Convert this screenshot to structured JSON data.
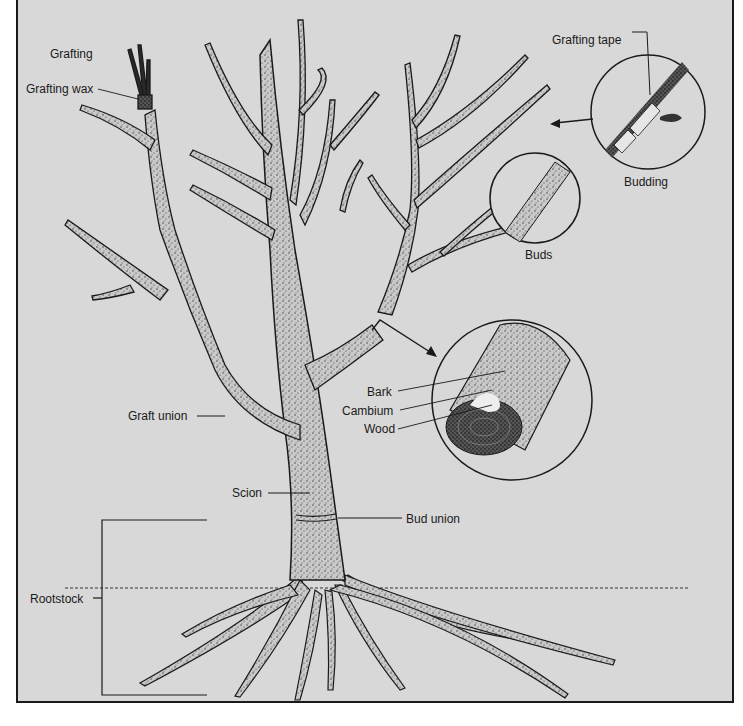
{
  "diagram": {
    "background_color": "#d8d8d8",
    "ink_color": "#1a1a1a",
    "labels": {
      "grafting": "Grafting",
      "grafting_wax": "Grafting wax",
      "grafting_tape": "Grafting tape",
      "budding": "Budding",
      "buds": "Buds",
      "bark": "Bark",
      "cambium": "Cambium",
      "wood": "Wood",
      "graft_union": "Graft union",
      "scion": "Scion",
      "bud_union": "Bud union",
      "rootstock": "Rootstock"
    },
    "insets": [
      {
        "name": "budding-detail",
        "caption": "Budding"
      },
      {
        "name": "buds-detail",
        "caption": "Buds"
      },
      {
        "name": "cross-section-detail",
        "parts": [
          "Bark",
          "Cambium",
          "Wood"
        ]
      }
    ]
  }
}
